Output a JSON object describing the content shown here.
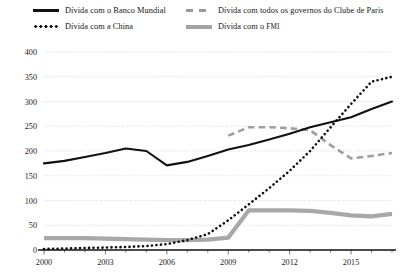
{
  "chart_data": {
    "type": "line",
    "title": "",
    "xlabel": "",
    "ylabel": "",
    "ylim": [
      0,
      400
    ],
    "ytick_step": 50,
    "yticks": [
      "0",
      "50",
      "100",
      "150",
      "200",
      "250",
      "300",
      "350",
      "400"
    ],
    "xlim": [
      2000,
      2017
    ],
    "xticks": [
      "2000",
      "2003",
      "2006",
      "2009",
      "2012",
      "2015"
    ],
    "xtick_years": [
      2000,
      2003,
      2006,
      2009,
      2012,
      2015
    ],
    "x": [
      2000,
      2001,
      2002,
      2003,
      2004,
      2005,
      2006,
      2007,
      2008,
      2009,
      2010,
      2011,
      2012,
      2013,
      2014,
      2015,
      2016,
      2017
    ],
    "grid": "horizontal-dotted",
    "legend_position": "top",
    "series": [
      {
        "name": "Dívida com o Banco Mundial",
        "style": "solid",
        "color": "#111111",
        "values": [
          175,
          180,
          188,
          196,
          205,
          200,
          171,
          178,
          190,
          203,
          212,
          223,
          235,
          248,
          258,
          268,
          285,
          300
        ]
      },
      {
        "name": "Dívida com a China",
        "style": "dotted",
        "color": "#111111",
        "values": [
          2,
          3,
          4,
          5,
          6,
          8,
          12,
          20,
          32,
          60,
          92,
          125,
          160,
          200,
          248,
          295,
          340,
          350
        ]
      },
      {
        "name": "Dívida com todos os governos do Clube de Paris",
        "style": "dashed",
        "color": "#9e9e9e",
        "values": [
          null,
          null,
          null,
          null,
          null,
          null,
          null,
          null,
          null,
          231,
          248,
          248,
          246,
          242,
          212,
          185,
          190,
          196
        ]
      },
      {
        "name": "Dívida com o FMI",
        "style": "thick",
        "color": "#a8a8a8",
        "values": [
          24,
          24,
          24,
          23,
          22,
          21,
          20,
          20,
          21,
          25,
          80,
          80,
          80,
          79,
          75,
          70,
          68,
          73
        ]
      }
    ]
  },
  "legend": {
    "items": [
      {
        "label": "Dívida com o Banco Mundial",
        "swatch": "solid-line-swatch"
      },
      {
        "label": "Dívida com a China",
        "swatch": "dotted-line-swatch"
      },
      {
        "label": "Dívida com todos os governos do Clube de Paris",
        "swatch": "dashed-line-swatch"
      },
      {
        "label_main": "Dívida com o ",
        "label_abbr": "FMI",
        "swatch": "thick-line-swatch"
      }
    ]
  }
}
